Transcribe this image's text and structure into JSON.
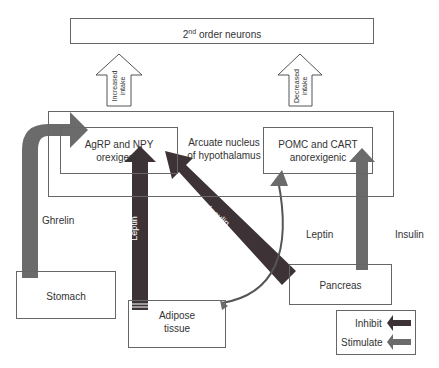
{
  "title_box": {
    "label_base": "2",
    "label_sup": "nd",
    "label_rest": " order neurons"
  },
  "arcuate": {
    "label_line1": "Arcuate  nucleus",
    "label_line2": "of hypothalamus"
  },
  "agrp": {
    "line1": "AgRP and NPY",
    "line2": "orexigenic"
  },
  "pomc": {
    "line1": "POMC and CART",
    "line2": "anorexigenic"
  },
  "up_arrows": [
    {
      "line1": "Increased",
      "line2": "intake"
    },
    {
      "line1": "Decreased",
      "line2": "intake"
    }
  ],
  "organs": {
    "stomach": "Stomach",
    "adipose_line1": "Adipose",
    "adipose_line2": "tissue",
    "pancreas": "Pancreas"
  },
  "signals": {
    "ghrelin": "Ghrelin",
    "leptin_vertical": "Leptin",
    "insulin_diag": "Insulin",
    "leptin_right": "Leptin",
    "insulin_right": "Insulin"
  },
  "legend": {
    "inhibit": "Inhibit",
    "stimulate": "Stimulate",
    "inhibit_color": "#3d3337",
    "stimulate_color": "#6b6b6b"
  }
}
